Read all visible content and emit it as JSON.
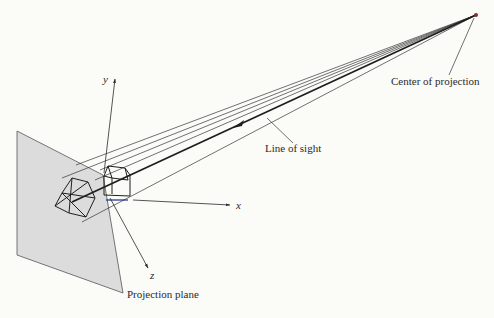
{
  "figure": {
    "labels": {
      "center_of_projection": "Center of projection",
      "line_of_sight": "Line of sight",
      "projection_plane": "Projection plane",
      "axis_x": "x",
      "axis_y": "y",
      "axis_z": "z"
    },
    "colors": {
      "background": "#fbfbf8",
      "plane_fill": "#dcdcdc",
      "line": "#2a2a2a",
      "highlight_edge": "#1a2a8a",
      "center_point": "#8a2a2a"
    }
  }
}
